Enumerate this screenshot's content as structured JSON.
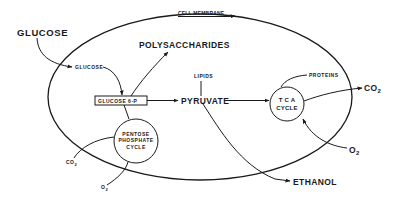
{
  "diagram": {
    "membrane_label": "CELL MEMBRANE",
    "glucose_outer": "GLUCOSE",
    "glucose_inner": "GLUCOSE",
    "polysaccharides": "POLYSACCHARIDES",
    "lipids": "LIPIDS",
    "glucose6p": "GLUCOSE  6-P",
    "pyruvate": "PYRUVATE",
    "tca_line1": "T C A",
    "tca_line2": "CYCLE",
    "proteins": "PROTEINS",
    "co2_right": "CO",
    "co2_right_sub": "2",
    "o2_right": "O",
    "o2_right_sub": "2",
    "pentose_line1": "PENTOSE",
    "pentose_line2": "PHOSPHATE",
    "pentose_line3": "CYCLE",
    "co2_left": "CO",
    "co2_left_sub": "2",
    "o2_left": "O",
    "o2_left_sub": "2",
    "ethanol": "ETHANOL"
  },
  "colors": {
    "ink": "#1a1a1a",
    "background": "#ffffff"
  }
}
